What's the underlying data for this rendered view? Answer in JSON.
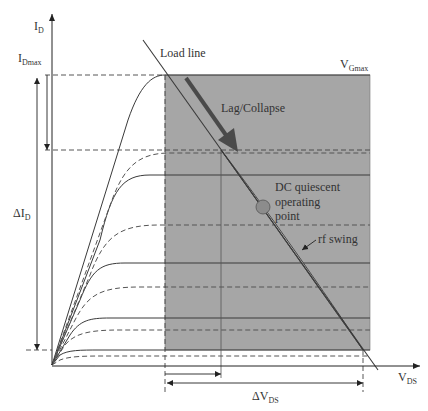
{
  "diagram": {
    "colors": {
      "shade": "#a6a6a6",
      "line": "#3a3a3a",
      "arrow_dark": "#4a4a4a",
      "qpoint": "#8c8c8c",
      "swing_fill": "#d0d0d0"
    },
    "labels": {
      "y_axis_main": "I",
      "y_axis_sub": "D",
      "idmax_main": "I",
      "idmax_sub": "Dmax",
      "delta_id_main": "ΔI",
      "delta_id_sub": "D",
      "x_axis_main": "V",
      "x_axis_sub": "DS",
      "delta_vds_main": "ΔV",
      "delta_vds_sub": "DS",
      "vgmax_main": "V",
      "vgmax_sub": "Gmax",
      "load_line": "Load line",
      "lag_collapse": "Lag/Collapse",
      "dc_q_line1": "DC quiescent",
      "dc_q_line2": "operating",
      "dc_q_line3": "point",
      "rf_swing": "rf swing"
    },
    "curves": {
      "solid_plateaus_y": [
        75,
        175,
        263,
        318,
        350
      ],
      "dashed_plateaus_y": [
        153,
        225,
        287,
        330,
        356
      ]
    }
  }
}
